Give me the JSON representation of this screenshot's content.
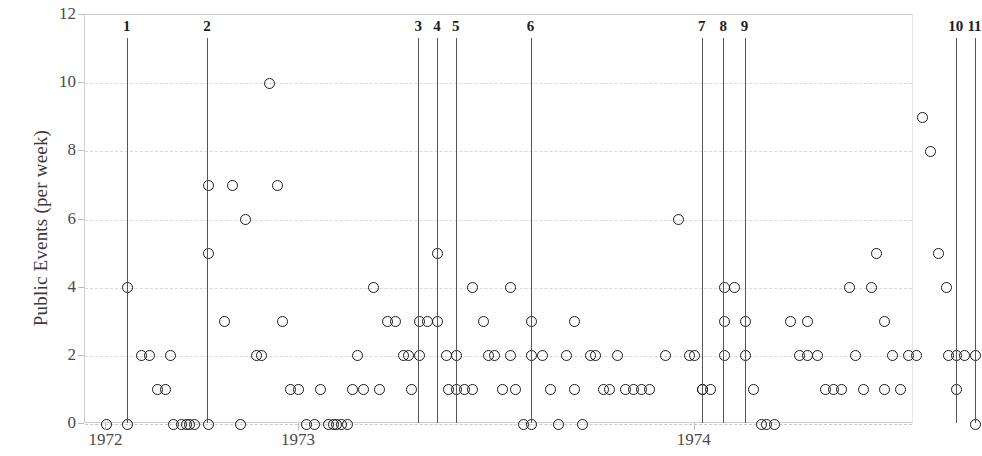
{
  "chart_data": {
    "type": "scatter",
    "title": "",
    "xlabel": "",
    "ylabel": "Public Events (per week)",
    "ylim": [
      0,
      12
    ],
    "yticks": [
      0,
      2,
      4,
      6,
      8,
      10,
      12
    ],
    "xlim": [
      1971.92,
      1975.02
    ],
    "xtick_labels": [
      "1972",
      "1973",
      "1974"
    ],
    "xtick_values": [
      1972.0,
      1972.72,
      1974.2
    ],
    "grid": true,
    "legend": null,
    "marker": "open-circle",
    "marker_color": "#1a1a1a",
    "event_lines": [
      {
        "label": "1",
        "x": 1972.08
      },
      {
        "label": "2",
        "x": 1972.38
      },
      {
        "label": "3",
        "x": 1973.17
      },
      {
        "label": "4",
        "x": 1973.24
      },
      {
        "label": "5",
        "x": 1973.31
      },
      {
        "label": "6",
        "x": 1973.59
      },
      {
        "label": "7",
        "x": 1974.23
      },
      {
        "label": "8",
        "x": 1974.31
      },
      {
        "label": "9",
        "x": 1974.39
      },
      {
        "label": "10",
        "x": 1975.18
      },
      {
        "label": "11",
        "x": 1975.25
      }
    ],
    "points": [
      [
        1972.0,
        0
      ],
      [
        1972.08,
        4
      ],
      [
        1972.08,
        0
      ],
      [
        1972.13,
        2
      ],
      [
        1972.16,
        2
      ],
      [
        1972.19,
        1
      ],
      [
        1972.22,
        1
      ],
      [
        1972.24,
        2
      ],
      [
        1972.25,
        0
      ],
      [
        1972.28,
        0
      ],
      [
        1972.3,
        0
      ],
      [
        1972.31,
        0
      ],
      [
        1972.33,
        0
      ],
      [
        1972.38,
        7
      ],
      [
        1972.38,
        5
      ],
      [
        1972.38,
        0
      ],
      [
        1972.44,
        3
      ],
      [
        1972.47,
        7
      ],
      [
        1972.5,
        0
      ],
      [
        1972.52,
        6
      ],
      [
        1972.56,
        2
      ],
      [
        1972.58,
        2
      ],
      [
        1972.61,
        10
      ],
      [
        1972.64,
        7
      ],
      [
        1972.66,
        3
      ],
      [
        1972.69,
        1
      ],
      [
        1972.72,
        1
      ],
      [
        1972.75,
        0
      ],
      [
        1972.78,
        0
      ],
      [
        1972.8,
        1
      ],
      [
        1972.83,
        0
      ],
      [
        1972.85,
        0
      ],
      [
        1972.86,
        0
      ],
      [
        1972.88,
        0
      ],
      [
        1972.9,
        0
      ],
      [
        1972.92,
        1
      ],
      [
        1972.94,
        2
      ],
      [
        1972.96,
        1
      ],
      [
        1973.0,
        4
      ],
      [
        1973.02,
        1
      ],
      [
        1973.05,
        3
      ],
      [
        1973.08,
        3
      ],
      [
        1973.11,
        2
      ],
      [
        1973.13,
        2
      ],
      [
        1973.14,
        1
      ],
      [
        1973.17,
        3
      ],
      [
        1973.17,
        2
      ],
      [
        1973.2,
        3
      ],
      [
        1973.24,
        3
      ],
      [
        1973.24,
        5
      ],
      [
        1973.27,
        2
      ],
      [
        1973.28,
        1
      ],
      [
        1973.31,
        2
      ],
      [
        1973.31,
        1
      ],
      [
        1973.34,
        1
      ],
      [
        1973.37,
        4
      ],
      [
        1973.37,
        1
      ],
      [
        1973.41,
        3
      ],
      [
        1973.43,
        2
      ],
      [
        1973.45,
        2
      ],
      [
        1973.48,
        1
      ],
      [
        1973.51,
        4
      ],
      [
        1973.51,
        2
      ],
      [
        1973.53,
        1
      ],
      [
        1973.56,
        0
      ],
      [
        1973.59,
        3
      ],
      [
        1973.59,
        2
      ],
      [
        1973.59,
        0
      ],
      [
        1973.63,
        2
      ],
      [
        1973.66,
        1
      ],
      [
        1973.69,
        0
      ],
      [
        1973.72,
        2
      ],
      [
        1973.75,
        3
      ],
      [
        1973.75,
        1
      ],
      [
        1973.78,
        0
      ],
      [
        1973.81,
        2
      ],
      [
        1973.83,
        2
      ],
      [
        1973.86,
        1
      ],
      [
        1973.88,
        1
      ],
      [
        1973.91,
        2
      ],
      [
        1973.94,
        1
      ],
      [
        1973.97,
        1
      ],
      [
        1974.0,
        1
      ],
      [
        1974.03,
        1
      ],
      [
        1974.09,
        2
      ],
      [
        1974.14,
        6
      ],
      [
        1974.18,
        2
      ],
      [
        1974.2,
        2
      ],
      [
        1974.23,
        1
      ],
      [
        1974.23,
        1
      ],
      [
        1974.26,
        1
      ],
      [
        1974.31,
        4
      ],
      [
        1974.31,
        3
      ],
      [
        1974.31,
        2
      ],
      [
        1974.35,
        4
      ],
      [
        1974.39,
        3
      ],
      [
        1974.39,
        2
      ],
      [
        1974.42,
        1
      ],
      [
        1974.45,
        0
      ],
      [
        1974.47,
        0
      ],
      [
        1974.5,
        0
      ],
      [
        1974.56,
        3
      ],
      [
        1974.59,
        2
      ],
      [
        1974.62,
        2
      ],
      [
        1974.62,
        3
      ],
      [
        1974.66,
        2
      ],
      [
        1974.69,
        1
      ],
      [
        1974.72,
        1
      ],
      [
        1974.75,
        1
      ],
      [
        1974.78,
        4
      ],
      [
        1974.8,
        2
      ],
      [
        1974.83,
        1
      ],
      [
        1974.86,
        4
      ],
      [
        1974.88,
        5
      ],
      [
        1974.91,
        3
      ],
      [
        1974.91,
        1
      ],
      [
        1974.94,
        2
      ],
      [
        1974.97,
        1
      ],
      [
        1975.0,
        2
      ],
      [
        1975.03,
        2
      ],
      [
        1975.05,
        9
      ],
      [
        1975.08,
        8
      ],
      [
        1975.11,
        5
      ],
      [
        1975.14,
        4
      ],
      [
        1975.15,
        2
      ],
      [
        1975.18,
        2
      ],
      [
        1975.18,
        1
      ],
      [
        1975.21,
        2
      ],
      [
        1975.25,
        2
      ],
      [
        1975.25,
        0
      ]
    ]
  },
  "axes": {
    "y_title": "Public Events (per week)",
    "y_tick_labels": [
      "0",
      "2",
      "4",
      "6",
      "8",
      "10",
      "12"
    ],
    "x_year_labels": [
      "1972",
      "1973",
      "1974"
    ]
  },
  "event_labels": [
    "1",
    "2",
    "3",
    "4",
    "5",
    "6",
    "7",
    "8",
    "9",
    "10",
    "11"
  ]
}
